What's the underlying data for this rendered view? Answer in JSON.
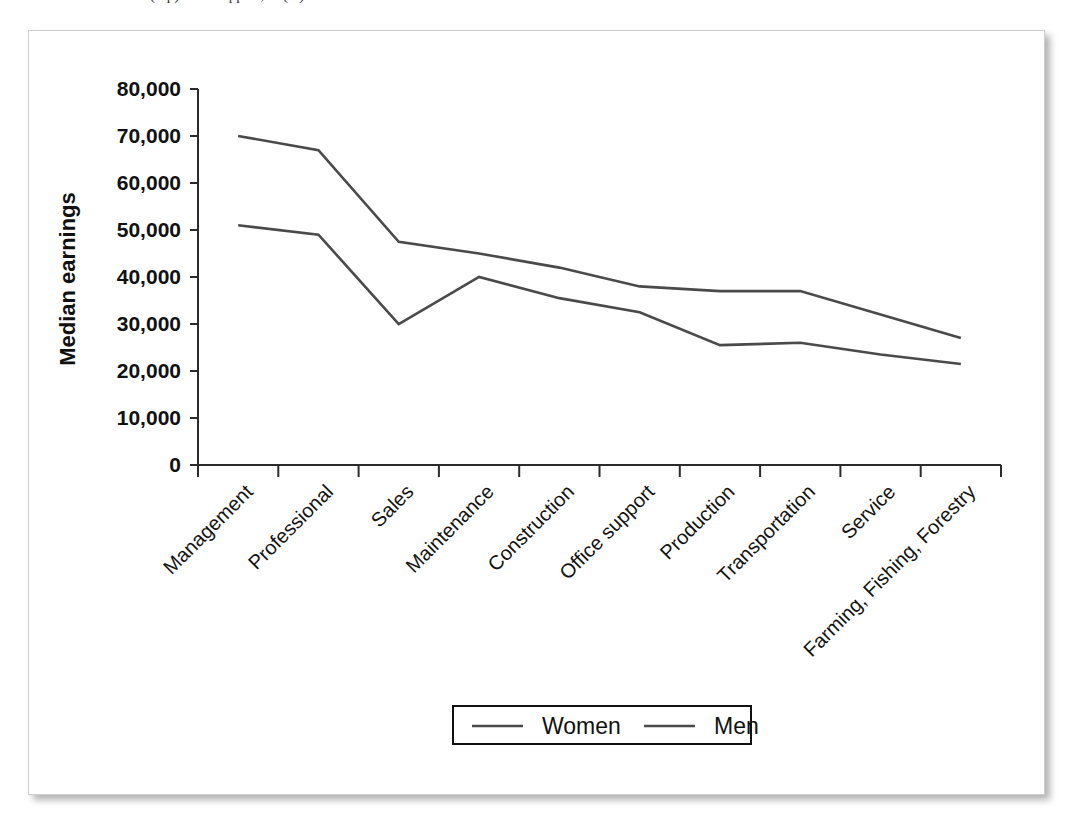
{
  "caption": {
    "text": "(top) ....... Support, ... (...)"
  },
  "chart_data": {
    "type": "line",
    "title": "",
    "xlabel": "",
    "ylabel": "Median earnings",
    "ylim": [
      0,
      80000
    ],
    "ytick_labels": [
      "0",
      "10,000",
      "20,000",
      "30,000",
      "40,000",
      "50,000",
      "60,000",
      "70,000",
      "80,000"
    ],
    "ytick_values": [
      0,
      10000,
      20000,
      30000,
      40000,
      50000,
      60000,
      70000,
      80000
    ],
    "grid": false,
    "legend_position": "bottom-center",
    "categories": [
      "Management",
      "Professional",
      "Sales",
      "Maintenance",
      "Construction",
      "Office support",
      "Production",
      "Transportation",
      "Service",
      "Farming, Fishing, Forestry"
    ],
    "series": [
      {
        "name": "Women",
        "color": "#4a4a4a",
        "values": [
          51000,
          49000,
          30000,
          40000,
          35500,
          32500,
          25500,
          26000,
          23500,
          21500
        ]
      },
      {
        "name": "Men",
        "color": "#4a4a4a",
        "values": [
          70000,
          67000,
          47500,
          45000,
          42000,
          38000,
          37000,
          37000,
          32000,
          27000
        ]
      }
    ]
  },
  "legend": {
    "items": [
      {
        "label": "Women"
      },
      {
        "label": "Men"
      }
    ]
  }
}
